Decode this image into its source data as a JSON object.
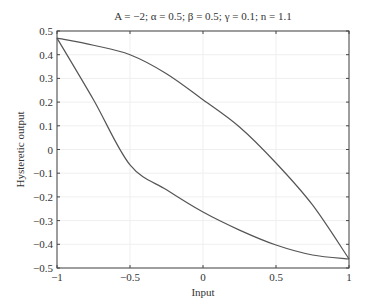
{
  "chart_data": {
    "type": "line",
    "title": "A = −2; α = 0.5; β = 0.5; γ = 0.1; n = 1.1",
    "xlabel": "Input",
    "ylabel": "Hysteretic output",
    "xlim": [
      -1,
      1
    ],
    "ylim": [
      -0.5,
      0.5
    ],
    "grid": true,
    "xticks": [
      -1,
      -0.5,
      0,
      0.5,
      1
    ],
    "xtick_labels": [
      "−1",
      "−0.5",
      "0",
      "0.5",
      "1"
    ],
    "yticks": [
      -0.5,
      -0.4,
      -0.3,
      -0.2,
      -0.1,
      0,
      0.1,
      0.2,
      0.3,
      0.4,
      0.5
    ],
    "ytick_labels": [
      "−0.5",
      "−0.4",
      "−0.3",
      "−0.2",
      "−0.1",
      "0",
      "0.1",
      "0.2",
      "0.3",
      "0.4",
      "0.5"
    ],
    "line_color": "#555555",
    "series": [
      {
        "name": "upper-branch",
        "x": [
          -1,
          -0.75,
          -0.5,
          -0.25,
          0,
          0.25,
          0.5,
          0.75,
          1
        ],
        "y": [
          0.47,
          0.44,
          0.4,
          0.32,
          0.21,
          0.095,
          -0.057,
          -0.234,
          -0.462
        ]
      },
      {
        "name": "lower-branch",
        "x": [
          -1,
          -0.75,
          -0.5,
          -0.25,
          0,
          0.25,
          0.5,
          0.75,
          1
        ],
        "y": [
          0.47,
          0.21,
          -0.065,
          -0.17,
          -0.264,
          -0.34,
          -0.403,
          -0.445,
          -0.462
        ]
      }
    ]
  }
}
